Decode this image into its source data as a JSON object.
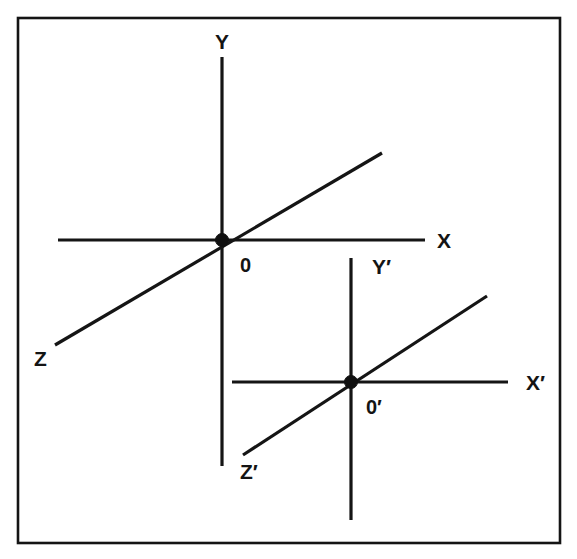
{
  "figure": {
    "background_color": "#ffffff",
    "line_color": "#151515",
    "frame": {
      "name": "figure-border",
      "x": 18,
      "y": 18,
      "width": 542,
      "height": 525,
      "stroke_width": 2.6
    },
    "systems": [
      {
        "id": "unprimed",
        "origin_label": "0",
        "origin_label_x": 240,
        "origin_label_y": 272,
        "origin_x": 222,
        "origin_y": 240,
        "axes": [
          {
            "id": "x-axis",
            "label": "X",
            "label_x": 437,
            "label_y": 248,
            "x1": 58,
            "y1": 240,
            "x2": 425,
            "y2": 240
          },
          {
            "id": "y-axis",
            "label": "Y",
            "label_x": 215,
            "label_y": 49,
            "x1": 222,
            "y1": 57,
            "x2": 222,
            "y2": 466
          },
          {
            "id": "z-axis",
            "label": "Z",
            "label_x": 34,
            "label_y": 366,
            "x1": 55,
            "y1": 345,
            "x2": 382,
            "y2": 153
          }
        ]
      },
      {
        "id": "primed",
        "origin_label": "0′",
        "origin_label_x": 366,
        "origin_label_y": 414,
        "origin_x": 351,
        "origin_y": 382,
        "axes": [
          {
            "id": "x-prime-axis",
            "label": "X′",
            "label_x": 526,
            "label_y": 390,
            "x1": 232,
            "y1": 382,
            "x2": 508,
            "y2": 382
          },
          {
            "id": "y-prime-axis",
            "label": "Y′",
            "label_x": 372,
            "label_y": 274,
            "x1": 351,
            "y1": 258,
            "x2": 351,
            "y2": 520
          },
          {
            "id": "z-prime-axis",
            "label": "Z′",
            "label_x": 240,
            "label_y": 479,
            "x1": 243,
            "y1": 455,
            "x2": 487,
            "y2": 296
          }
        ]
      }
    ]
  },
  "chart_data": {
    "type": "diagram",
    "labels": [
      "Y",
      "X",
      "0",
      "Z",
      "Y′",
      "X′",
      "0′",
      "Z′"
    ],
    "grid": false,
    "legend": null,
    "frames": [
      {
        "origin": "0",
        "origin_pixel": [
          222,
          240
        ],
        "axis_labels": [
          "X",
          "Y",
          "Z"
        ],
        "x_axis_pixels": [
          [
            58,
            240
          ],
          [
            425,
            240
          ]
        ],
        "y_axis_pixels": [
          [
            222,
            57
          ],
          [
            222,
            466
          ]
        ],
        "z_axis_pixels": [
          [
            55,
            345
          ],
          [
            382,
            153
          ]
        ]
      },
      {
        "origin": "0′",
        "origin_pixel": [
          351,
          382
        ],
        "axis_labels": [
          "X′",
          "Y′",
          "Z′"
        ],
        "x_axis_pixels": [
          [
            232,
            382
          ],
          [
            508,
            382
          ]
        ],
        "y_axis_pixels": [
          [
            351,
            258
          ],
          [
            351,
            520
          ]
        ],
        "z_axis_pixels": [
          [
            243,
            455
          ],
          [
            487,
            296
          ]
        ]
      }
    ]
  }
}
